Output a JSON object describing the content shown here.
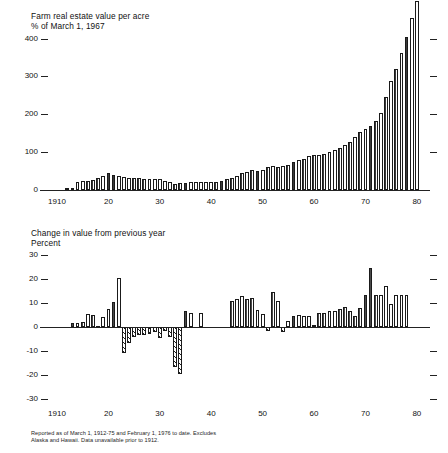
{
  "figure": {
    "footnote_line1": "Reported as of March 1, 1912-75 and February 1, 1976 to date. Excludes",
    "footnote_line2": "Alaska and Hawaii. Data unavailable prior to 1912."
  },
  "chart_data": [
    {
      "type": "bar",
      "title": "Farm real estate value per acre",
      "subtitle": "% of March 1, 1967",
      "ylabel": "% of March 1, 1967",
      "xlabel": "",
      "ylim": [
        0,
        420
      ],
      "yticks": [
        0,
        100,
        200,
        300,
        400
      ],
      "ytick_labels": [
        "0",
        "100",
        "200",
        "300",
        "400"
      ],
      "xlim": [
        1910,
        1981
      ],
      "xticks": [
        1910,
        1920,
        1930,
        1940,
        1950,
        1960,
        1970,
        1980
      ],
      "xtick_labels": [
        "1910",
        "20",
        "30",
        "40",
        "50",
        "60",
        "70",
        "80"
      ],
      "grid": false,
      "legend": "none",
      "right_ticks": [
        100,
        200,
        300,
        400
      ],
      "x": [
        1910,
        1911,
        1912,
        1913,
        1914,
        1915,
        1916,
        1917,
        1918,
        1919,
        1920,
        1921,
        1922,
        1923,
        1924,
        1925,
        1926,
        1927,
        1928,
        1929,
        1930,
        1931,
        1932,
        1933,
        1934,
        1935,
        1936,
        1937,
        1938,
        1939,
        1940,
        1941,
        1942,
        1943,
        1944,
        1945,
        1946,
        1947,
        1948,
        1949,
        1950,
        1951,
        1952,
        1953,
        1954,
        1955,
        1956,
        1957,
        1958,
        1959,
        1960,
        1961,
        1962,
        1963,
        1964,
        1965,
        1966,
        1967,
        1968,
        1969,
        1970,
        1971,
        1972,
        1973,
        1974,
        1975,
        1976,
        1977,
        1978,
        1979,
        1980
      ],
      "values": [
        0,
        0,
        3,
        4,
        22,
        23,
        24,
        26,
        31,
        37,
        45,
        40,
        36,
        34,
        33,
        32,
        31,
        30,
        29,
        29,
        28,
        25,
        20,
        17,
        18,
        19,
        20,
        21,
        21,
        20,
        20,
        21,
        24,
        28,
        32,
        37,
        44,
        48,
        52,
        50,
        53,
        62,
        64,
        62,
        63,
        67,
        73,
        78,
        83,
        90,
        92,
        93,
        96,
        100,
        106,
        112,
        119,
        127,
        139,
        153,
        161,
        170,
        182,
        204,
        246,
        288,
        320,
        363,
        404,
        455,
        500
      ],
      "values_unit": "index (1967=100)",
      "note": "bar heights relative to 1967 = 100"
    },
    {
      "type": "bar",
      "title": "Change in value from previous year",
      "subtitle": "Percent",
      "ylabel": "Percent",
      "xlabel": "",
      "ylim": [
        -32,
        32
      ],
      "yticks": [
        -30,
        -20,
        -10,
        0,
        10,
        20,
        30
      ],
      "ytick_labels": [
        "-30",
        "-20",
        "-10",
        "0",
        "10",
        "20",
        "30"
      ],
      "xlim": [
        1910,
        1981
      ],
      "xticks": [
        1910,
        1920,
        1930,
        1940,
        1950,
        1960,
        1970,
        1980
      ],
      "xtick_labels": [
        "1910",
        "20",
        "30",
        "40",
        "50",
        "60",
        "70",
        "80"
      ],
      "grid": false,
      "legend": "none",
      "right_ticks": [
        -30,
        -20,
        -10,
        10,
        20,
        30
      ],
      "x": [
        1913,
        1914,
        1915,
        1916,
        1917,
        1918,
        1919,
        1920,
        1921,
        1922,
        1923,
        1924,
        1925,
        1926,
        1927,
        1928,
        1929,
        1930,
        1931,
        1932,
        1933,
        1934,
        1935,
        1936,
        1937,
        1938,
        1939,
        1940,
        1941,
        1942,
        1943,
        1944,
        1945,
        1946,
        1947,
        1948,
        1949,
        1950,
        1951,
        1952,
        1953,
        1954,
        1955,
        1956,
        1957,
        1958,
        1959,
        1960,
        1961,
        1962,
        1963,
        1964,
        1965,
        1966,
        1967,
        1968,
        1969,
        1970,
        1971,
        1972,
        1973,
        1974,
        1975,
        1976,
        1977,
        1978,
        1979,
        1980
      ],
      "values": [
        1.5,
        1.5,
        2.0,
        5.5,
        5.0,
        0.5,
        4.0,
        7.5,
        10.5,
        20.5,
        -11.0,
        -6.5,
        -4.0,
        -3.5,
        -3.5,
        -3.0,
        -2.0,
        -4.5,
        -1.5,
        -4.0,
        -16.5,
        -19.5,
        6.5,
        6.0,
        0.0,
        6.0,
        0.0,
        0.0,
        0.0,
        0.0,
        0.0,
        11.0,
        11.5,
        13.0,
        11.5,
        12.0,
        7.0,
        5.5,
        -1.5,
        14.5,
        11.0,
        -2.0,
        2.5,
        4.5,
        5.0,
        4.5,
        4.5,
        1.0,
        6.0,
        6.0,
        6.5,
        6.5,
        7.5,
        8.5,
        6.5,
        4.5,
        8.0,
        13.5,
        24.5,
        13.5,
        13.5,
        17.0,
        9.5,
        13.5,
        13.5,
        13.5,
        0,
        0
      ],
      "values_unit": "percent change from previous year"
    }
  ]
}
